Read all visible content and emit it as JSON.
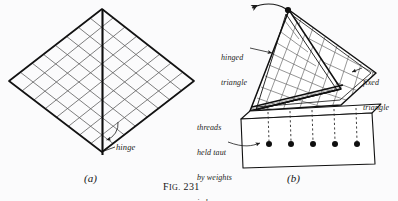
{
  "figure": {
    "caption_prefix": "F",
    "caption_smallcaps": "IG.",
    "caption_number": "231",
    "panels": [
      {
        "id": "a",
        "label": "(a)"
      },
      {
        "id": "b",
        "label": "(b)"
      }
    ]
  },
  "panel_a": {
    "name": "flat-hinged-grid-diamond",
    "annotations": [
      {
        "id": "hinge",
        "text": "hinge"
      }
    ]
  },
  "panel_b": {
    "name": "folded-apparatus-with-weight-box",
    "annotations": [
      {
        "id": "hinged_triangle",
        "lines": [
          "hinged",
          "triangle"
        ]
      },
      {
        "id": "fixed_triangle",
        "lines": [
          "fixed",
          "triangle"
        ]
      },
      {
        "id": "threads",
        "lines": [
          "threads",
          "held taut",
          "by weights",
          "in box"
        ]
      }
    ],
    "weights_count": 5,
    "threads_count": 5
  },
  "colors": {
    "background": "#fbfbfc",
    "ink": "#1b1b1b",
    "grid_ink": "#5b5b5b",
    "heavy_ink": "#111111"
  }
}
